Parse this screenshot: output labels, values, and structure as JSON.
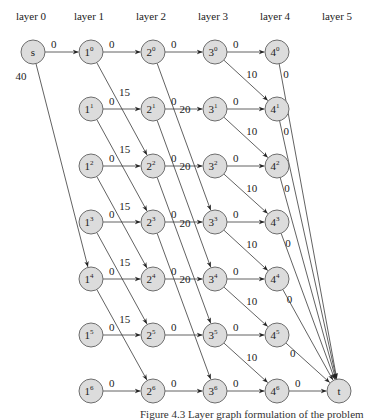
{
  "diagram": {
    "layers": [
      "layer 0",
      "layer 1",
      "layer 2",
      "layer 3",
      "layer 4",
      "layer 5"
    ],
    "source": {
      "id": "s",
      "label": "s"
    },
    "sink": {
      "id": "t",
      "label": "t"
    },
    "rows": 7,
    "nodes": [
      {
        "id": "s",
        "label": "s",
        "sup": ""
      },
      {
        "id": "1-0",
        "label": "1",
        "sup": "0"
      },
      {
        "id": "1-1",
        "label": "1",
        "sup": "1"
      },
      {
        "id": "1-2",
        "label": "1",
        "sup": "2"
      },
      {
        "id": "1-3",
        "label": "1",
        "sup": "3"
      },
      {
        "id": "1-4",
        "label": "1",
        "sup": "4"
      },
      {
        "id": "1-5",
        "label": "1",
        "sup": "5"
      },
      {
        "id": "1-6",
        "label": "1",
        "sup": "6"
      },
      {
        "id": "2-0",
        "label": "2",
        "sup": "0"
      },
      {
        "id": "2-1",
        "label": "2",
        "sup": "1"
      },
      {
        "id": "2-2",
        "label": "2",
        "sup": "2"
      },
      {
        "id": "2-3",
        "label": "2",
        "sup": "3"
      },
      {
        "id": "2-4",
        "label": "2",
        "sup": "4"
      },
      {
        "id": "2-5",
        "label": "2",
        "sup": "5"
      },
      {
        "id": "2-6",
        "label": "2",
        "sup": "6"
      },
      {
        "id": "3-0",
        "label": "3",
        "sup": "0"
      },
      {
        "id": "3-1",
        "label": "3",
        "sup": "1"
      },
      {
        "id": "3-2",
        "label": "3",
        "sup": "2"
      },
      {
        "id": "3-3",
        "label": "3",
        "sup": "3"
      },
      {
        "id": "3-4",
        "label": "3",
        "sup": "4"
      },
      {
        "id": "3-5",
        "label": "3",
        "sup": "5"
      },
      {
        "id": "3-6",
        "label": "3",
        "sup": "6"
      },
      {
        "id": "4-0",
        "label": "4",
        "sup": "0"
      },
      {
        "id": "4-1",
        "label": "4",
        "sup": "1"
      },
      {
        "id": "4-2",
        "label": "4",
        "sup": "2"
      },
      {
        "id": "4-3",
        "label": "4",
        "sup": "3"
      },
      {
        "id": "4-4",
        "label": "4",
        "sup": "4"
      },
      {
        "id": "4-5",
        "label": "4",
        "sup": "5"
      },
      {
        "id": "4-6",
        "label": "4",
        "sup": "6"
      },
      {
        "id": "t",
        "label": "t",
        "sup": ""
      }
    ],
    "edges": [
      {
        "from": "s",
        "to": "1-0",
        "weight": "0"
      },
      {
        "from": "s",
        "to": "1-4",
        "weight": "40"
      },
      {
        "from": "1-0",
        "to": "2-0",
        "weight": "0"
      },
      {
        "from": "1-1",
        "to": "2-1",
        "weight": "0"
      },
      {
        "from": "1-2",
        "to": "2-2",
        "weight": "0"
      },
      {
        "from": "1-3",
        "to": "2-3",
        "weight": "0"
      },
      {
        "from": "1-4",
        "to": "2-4",
        "weight": "0"
      },
      {
        "from": "1-5",
        "to": "2-5",
        "weight": "0"
      },
      {
        "from": "1-6",
        "to": "2-6",
        "weight": "0"
      },
      {
        "from": "1-0",
        "to": "2-2",
        "weight": "15"
      },
      {
        "from": "1-1",
        "to": "2-3",
        "weight": "15"
      },
      {
        "from": "1-2",
        "to": "2-4",
        "weight": "15"
      },
      {
        "from": "1-3",
        "to": "2-5",
        "weight": "15"
      },
      {
        "from": "1-4",
        "to": "2-6",
        "weight": "15"
      },
      {
        "from": "2-0",
        "to": "3-0",
        "weight": "0"
      },
      {
        "from": "2-1",
        "to": "3-1",
        "weight": "0"
      },
      {
        "from": "2-2",
        "to": "3-2",
        "weight": "0"
      },
      {
        "from": "2-3",
        "to": "3-3",
        "weight": "0"
      },
      {
        "from": "2-4",
        "to": "3-4",
        "weight": "0"
      },
      {
        "from": "2-5",
        "to": "3-5",
        "weight": "0"
      },
      {
        "from": "2-6",
        "to": "3-6",
        "weight": "0"
      },
      {
        "from": "2-0",
        "to": "3-3",
        "weight": "20"
      },
      {
        "from": "2-1",
        "to": "3-4",
        "weight": "20"
      },
      {
        "from": "2-2",
        "to": "3-5",
        "weight": "20"
      },
      {
        "from": "2-3",
        "to": "3-6",
        "weight": "20"
      },
      {
        "from": "3-0",
        "to": "4-0",
        "weight": "0"
      },
      {
        "from": "3-1",
        "to": "4-1",
        "weight": "0"
      },
      {
        "from": "3-2",
        "to": "4-2",
        "weight": "0"
      },
      {
        "from": "3-3",
        "to": "4-3",
        "weight": "0"
      },
      {
        "from": "3-4",
        "to": "4-4",
        "weight": "0"
      },
      {
        "from": "3-5",
        "to": "4-5",
        "weight": "0"
      },
      {
        "from": "3-6",
        "to": "4-6",
        "weight": "0"
      },
      {
        "from": "3-0",
        "to": "4-1",
        "weight": "10"
      },
      {
        "from": "3-1",
        "to": "4-2",
        "weight": "10"
      },
      {
        "from": "3-2",
        "to": "4-3",
        "weight": "10"
      },
      {
        "from": "3-3",
        "to": "4-4",
        "weight": "10"
      },
      {
        "from": "3-4",
        "to": "4-5",
        "weight": "10"
      },
      {
        "from": "3-5",
        "to": "4-6",
        "weight": "10"
      },
      {
        "from": "4-0",
        "to": "t",
        "weight": "0"
      },
      {
        "from": "4-1",
        "to": "t",
        "weight": "0"
      },
      {
        "from": "4-2",
        "to": "t",
        "weight": "0"
      },
      {
        "from": "4-3",
        "to": "t",
        "weight": "0"
      },
      {
        "from": "4-4",
        "to": "t",
        "weight": "0"
      },
      {
        "from": "4-5",
        "to": "t",
        "weight": "0"
      },
      {
        "from": "4-6",
        "to": "t",
        "weight": "0"
      }
    ]
  },
  "caption": "Figure 4.3   Layer graph formulation of the problem"
}
